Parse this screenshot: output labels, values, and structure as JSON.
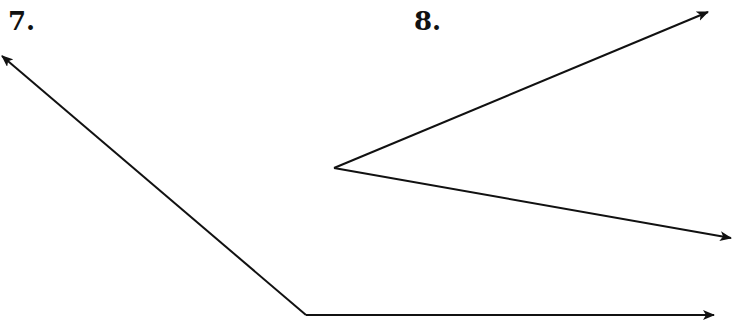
{
  "figures": [
    {
      "label": "7.",
      "vertex": [
        306,
        315
      ],
      "rays": [
        {
          "tip": [
            2,
            56
          ]
        },
        {
          "tip": [
            714,
            315
          ]
        }
      ]
    },
    {
      "label": "8.",
      "vertex": [
        334,
        168
      ],
      "rays": [
        {
          "tip": [
            708,
            12
          ]
        },
        {
          "tip": [
            731,
            238
          ]
        }
      ]
    }
  ],
  "colors": {
    "stroke": "#111111",
    "background": "#ffffff"
  }
}
